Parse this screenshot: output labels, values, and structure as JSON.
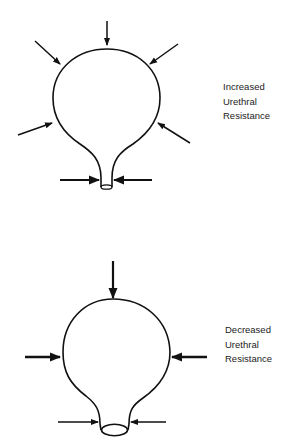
{
  "diagrams": [
    {
      "id": "increased",
      "label_lines": [
        "Increased",
        "Urethral",
        "Resistance"
      ],
      "description": "Bladder distended with narrow urethral outlet; pressure arrows surround the dome"
    },
    {
      "id": "decreased",
      "label_lines": [
        "Decreased",
        "Urethral",
        "Resistance"
      ],
      "description": "Bladder with wide urethral outlet; fewer pressure arrows"
    }
  ],
  "colors": {
    "stroke": "#111111",
    "background": "#ffffff",
    "text": "#222222"
  }
}
